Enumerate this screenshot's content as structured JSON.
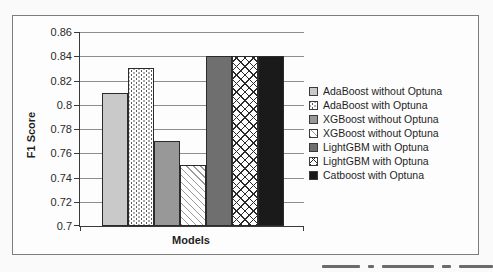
{
  "chart_data": {
    "type": "bar",
    "title": "",
    "xlabel": "Models",
    "ylabel": "F1 Score",
    "ylim": [
      0.7,
      0.86
    ],
    "ytick_step": 0.02,
    "ytick_labels": [
      "0.7",
      "0.72",
      "0.74",
      "0.76",
      "0.78",
      "0.8",
      "0.82",
      "0.84",
      "0.86"
    ],
    "grid": true,
    "legend_position": "right",
    "categories": [
      "Models"
    ],
    "series": [
      {
        "name": "AdaBoost without Optuna",
        "value": 0.81,
        "fill": "solid-lightgray",
        "color": "#c9c9c9"
      },
      {
        "name": "AdaBoost with Optuna",
        "value": 0.83,
        "fill": "dotted",
        "color": "#ffffff"
      },
      {
        "name": "XGBoost without Optuna",
        "value": 0.77,
        "fill": "solid-gray",
        "color": "#989898"
      },
      {
        "name": "XGBoost without Optuna",
        "value": 0.75,
        "fill": "diagonal-hatch",
        "color": "#ffffff"
      },
      {
        "name": "LightGBM with Optuna",
        "value": 0.84,
        "fill": "solid-darkgray",
        "color": "#6f6f6f"
      },
      {
        "name": "LightGBM with Optuna",
        "value": 0.84,
        "fill": "crosshatch",
        "color": "#ffffff"
      },
      {
        "name": "Catboost with Optuna",
        "value": 0.84,
        "fill": "solid-black",
        "color": "#1a1a1a"
      }
    ],
    "bar_border_color": "#2b2b2b",
    "axis_color": "#3a3a3a",
    "gridline_color": "#8f8f8f"
  }
}
